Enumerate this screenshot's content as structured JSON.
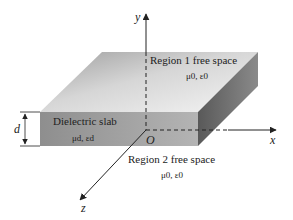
{
  "diagram": {
    "axes": {
      "x_label": "x",
      "y_label": "y",
      "z_label": "z",
      "origin_label": "O"
    },
    "regions": {
      "region1": {
        "title": "Region 1 free space",
        "params": "μ0, ε0"
      },
      "slab": {
        "title": "Dielectric slab",
        "params": "μd, εd"
      },
      "region2": {
        "title": "Region 2 free space",
        "params": "μ0, ε0"
      }
    },
    "thickness_label": "d",
    "colors": {
      "top_face_light": "#eeeeee",
      "top_face_dark": "#a9a9a9",
      "front_face": "#9c9c9c",
      "side_face": "#6e6e6e",
      "line": "#222222"
    }
  }
}
